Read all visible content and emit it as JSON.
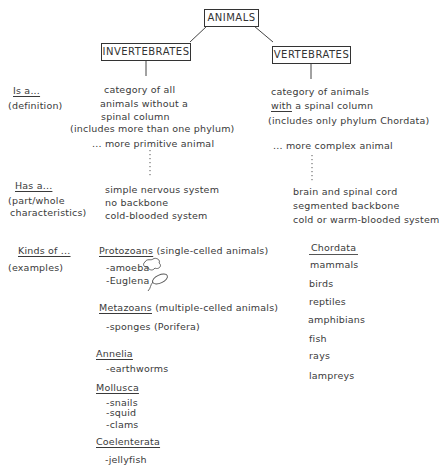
{
  "root": {
    "label": "ANIMALS"
  },
  "branches": [
    {
      "label": "INVERTEBRATES"
    },
    {
      "label": "VERTEBRATES"
    }
  ],
  "row_labels": {
    "is_a": {
      "title": "Is a...",
      "sub": [
        "(definition)"
      ]
    },
    "has_a": {
      "title": "Has a...",
      "sub": [
        "(part/whole",
        "characteristics)"
      ]
    },
    "kinds_of": {
      "title": "Kinds of ...",
      "sub": [
        "(examples)"
      ]
    }
  },
  "invertebrates": {
    "definition": [
      "category of all",
      "animals  without a",
      "spinal column",
      "(includes more than one phylum)"
    ],
    "comparison": "... more primitive animal",
    "characteristics": [
      "simple nervous system",
      "no backbone",
      "cold-blooded system"
    ],
    "kinds": [
      {
        "group": "Protozoans",
        "note": " (single-celled animals)",
        "examples": [
          "-amoeba",
          "-Euglena"
        ]
      },
      {
        "group": "Metazoans",
        "note": " (multiple-celled animals)",
        "examples": [
          "-sponges (Porifera)"
        ]
      },
      {
        "group": "Annelia",
        "note": "",
        "examples": [
          "-earthworms"
        ]
      },
      {
        "group": "Mollusca",
        "note": "",
        "examples": [
          "-snails",
          "-squid",
          "-clams"
        ]
      },
      {
        "group": "Coelenterata",
        "note": "",
        "examples": [
          "-jellyfish"
        ]
      }
    ]
  },
  "vertebrates": {
    "definition_line1": "category of animals",
    "definition_with": "with",
    "definition_line2_rest": " a spinal column",
    "definition_line3": "(includes only phylum Chordata)",
    "comparison": "... more complex animal",
    "characteristics": [
      "brain and spinal cord",
      "segmented backbone",
      "cold or warm-blooded system"
    ],
    "kinds": {
      "group": "Chordata",
      "examples": [
        "mammals",
        "birds",
        "reptiles",
        "amphibians",
        "fish",
        "rays",
        "lampreys"
      ]
    }
  }
}
